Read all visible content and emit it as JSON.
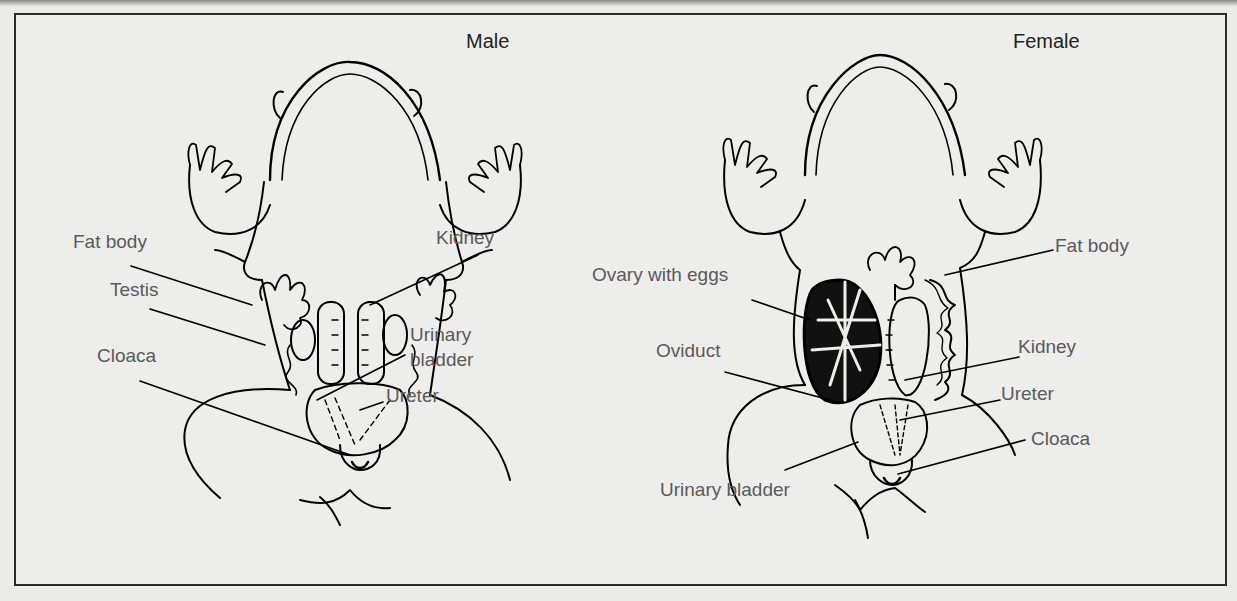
{
  "figure": {
    "panels": [
      {
        "title": "Male",
        "labels": {
          "fat_body": "Fat body",
          "testis": "Testis",
          "cloaca": "Cloaca",
          "kidney": "Kidney",
          "urinary_bladder_1": "Urinary",
          "urinary_bladder_2": "bladder",
          "ureter": "Ureter"
        }
      },
      {
        "title": "Female",
        "labels": {
          "fat_body": "Fat body",
          "ovary": "Ovary with eggs",
          "oviduct": "Oviduct",
          "kidney": "Kidney",
          "ureter": "Ureter",
          "cloaca": "Cloaca",
          "urinary_bladder": "Urinary bladder"
        }
      }
    ]
  },
  "colors": {
    "background": "#ebebea",
    "line_art": "#000000",
    "label_text": "#5a5a5a",
    "frame": "#2a2a2a"
  }
}
